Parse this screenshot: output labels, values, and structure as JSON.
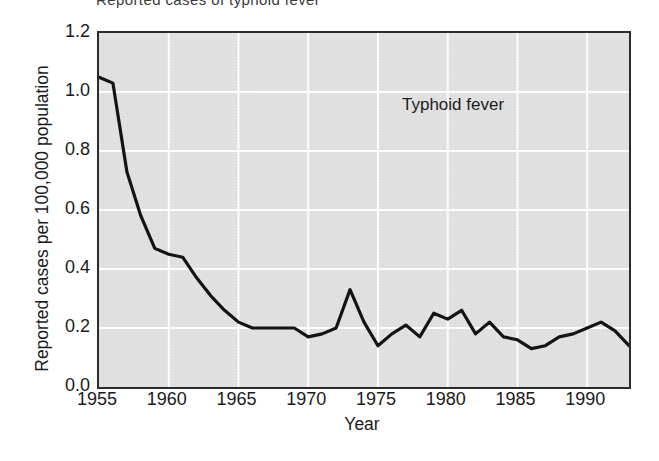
{
  "caption_fragment": "Reported cases of typhoid fever",
  "chart_data": {
    "type": "line",
    "title": "",
    "annotation": "Typhoid fever",
    "xlabel": "Year",
    "ylabel": "Reported cases per 100,000 population",
    "xlim": [
      1955,
      1993
    ],
    "ylim": [
      0.0,
      1.2
    ],
    "xticks": [
      1955,
      1960,
      1965,
      1970,
      1975,
      1980,
      1985,
      1990
    ],
    "xtick_labels": [
      "1955",
      "1960",
      "1965",
      "1970",
      "1975",
      "1980",
      "1985",
      "1990"
    ],
    "yticks": [
      0.0,
      0.2,
      0.4,
      0.6,
      0.8,
      1.0,
      1.2
    ],
    "ytick_labels": [
      "0.0",
      "0.2",
      "0.4",
      "0.6",
      "0.8",
      "1.0",
      "1.2"
    ],
    "grid": true,
    "grid_color": "#ffffff",
    "plot_background": "#e2e2e2",
    "line_color": "#141414",
    "line_width": 3.2,
    "markers": false,
    "legend": "none",
    "x": [
      1955,
      1956,
      1957,
      1958,
      1959,
      1960,
      1961,
      1962,
      1963,
      1964,
      1965,
      1966,
      1967,
      1968,
      1969,
      1970,
      1971,
      1972,
      1973,
      1974,
      1975,
      1976,
      1977,
      1978,
      1979,
      1980,
      1981,
      1982,
      1983,
      1984,
      1985,
      1986,
      1987,
      1988,
      1989,
      1990,
      1991,
      1992,
      1993
    ],
    "values": [
      1.05,
      1.03,
      0.73,
      0.58,
      0.47,
      0.45,
      0.44,
      0.37,
      0.31,
      0.26,
      0.22,
      0.2,
      0.2,
      0.2,
      0.2,
      0.17,
      0.18,
      0.2,
      0.33,
      0.22,
      0.14,
      0.18,
      0.21,
      0.17,
      0.25,
      0.23,
      0.26,
      0.18,
      0.22,
      0.17,
      0.16,
      0.13,
      0.14,
      0.17,
      0.18,
      0.2,
      0.22,
      0.19,
      0.14
    ],
    "series": [
      {
        "name": "Typhoid fever",
        "values": [
          1.05,
          1.03,
          0.73,
          0.58,
          0.47,
          0.45,
          0.44,
          0.37,
          0.31,
          0.26,
          0.22,
          0.2,
          0.2,
          0.2,
          0.2,
          0.17,
          0.18,
          0.2,
          0.33,
          0.22,
          0.14,
          0.18,
          0.21,
          0.17,
          0.25,
          0.23,
          0.26,
          0.18,
          0.22,
          0.17,
          0.16,
          0.13,
          0.14,
          0.17,
          0.18,
          0.2,
          0.22,
          0.19,
          0.14
        ]
      }
    ]
  }
}
